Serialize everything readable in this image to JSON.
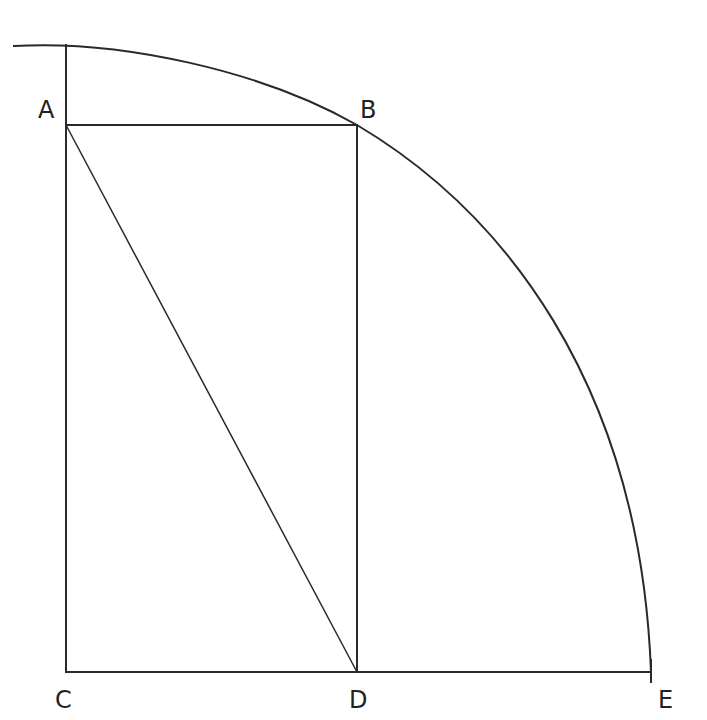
{
  "diagram": {
    "type": "geometric construction",
    "points": {
      "A": {
        "label": "A",
        "x": 66,
        "y": 125
      },
      "B": {
        "label": "B",
        "x": 357,
        "y": 125
      },
      "C": {
        "label": "C",
        "x": 66,
        "y": 672
      },
      "D": {
        "label": "D",
        "x": 357,
        "y": 672
      },
      "E": {
        "label": "E",
        "x": 651,
        "y": 672
      }
    },
    "segments": [
      "AB",
      "AC",
      "BD",
      "CD",
      "DE",
      "AD"
    ],
    "arc": {
      "from": "top-left",
      "through": "B",
      "to": "E"
    },
    "colors": {
      "stroke": "#2a2a2a",
      "background": "#ffffff"
    }
  }
}
